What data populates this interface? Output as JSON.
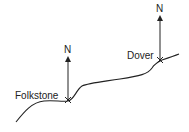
{
  "diagram": {
    "places": [
      {
        "name": "Folkstone",
        "north_label": "N"
      },
      {
        "name": "Dover",
        "north_label": "N"
      }
    ],
    "colors": {
      "line": "#222222",
      "background": "#ffffff"
    }
  }
}
